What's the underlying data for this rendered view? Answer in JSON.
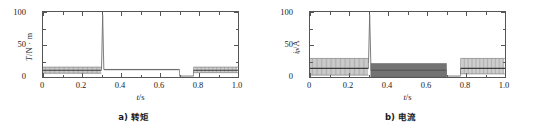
{
  "figure": {
    "panels": [
      {
        "id": "panel-torque",
        "caption": "a) 转矩",
        "ylabel_main": "T",
        "ylabel_unit": "/N · m",
        "xlabel_var": "t",
        "xlabel_unit": "/s"
      },
      {
        "id": "panel-current",
        "caption": "b) 电流",
        "ylabel_main": "i",
        "ylabel_sub": "p",
        "ylabel_unit": "/A",
        "xlabel_var": "t",
        "xlabel_unit": "/s"
      }
    ]
  },
  "chart_data": [
    {
      "type": "line",
      "id": "torque",
      "title": "a) 转矩",
      "xlabel": "t/s",
      "ylabel": "T/N · m",
      "xlim": [
        0,
        1.0
      ],
      "ylim": [
        0,
        105
      ],
      "xticks": [
        0,
        0.2,
        0.4,
        0.6,
        0.8,
        1.0
      ],
      "xticklabels": [
        "0",
        "0.2",
        "0.4",
        "0.6",
        "0.8",
        "1.0"
      ],
      "yticks": [
        0,
        50,
        100
      ],
      "yticklabels": [
        "0",
        "50",
        "100"
      ],
      "grid": false,
      "legend": "none",
      "line_color": "#6e6e6e",
      "segments": [
        {
          "name": "startup-oscillation",
          "x_start": 0.0,
          "x_end": 0.3,
          "mode": "oscillating-band",
          "y_low": 6,
          "y_high": 16,
          "y_mean": 11,
          "cycles": 46,
          "note": "dense square-wave ripple band"
        },
        {
          "name": "load-step-spike",
          "x_start": 0.3,
          "x_end": 0.312,
          "mode": "spike",
          "y_peak": 100,
          "y_base": 12
        },
        {
          "name": "steady-load",
          "x_start": 0.312,
          "x_end": 0.7,
          "mode": "flat-band",
          "y_low": 11,
          "y_high": 13,
          "y_mean": 12
        },
        {
          "name": "unload-dip",
          "x_start": 0.7,
          "x_end": 0.772,
          "mode": "flat",
          "y_mean": 1.5
        },
        {
          "name": "restart-oscillation",
          "x_start": 0.772,
          "x_end": 1.0,
          "mode": "oscillating-band",
          "y_low": 7,
          "y_high": 16,
          "y_mean": 11,
          "cycles": 33
        }
      ]
    },
    {
      "type": "line",
      "id": "current",
      "title": "b) 电流",
      "xlabel": "t/s",
      "ylabel": "i_p/A",
      "xlim": [
        0,
        1.0
      ],
      "ylim": [
        0,
        105
      ],
      "xticks": [
        0,
        0.2,
        0.4,
        0.6,
        0.8,
        1.0
      ],
      "xticklabels": [
        "0",
        "0.2",
        "0.4",
        "0.6",
        "0.8",
        "1.0"
      ],
      "yticks": [
        0,
        50,
        100
      ],
      "yticklabels": [
        "0",
        "50",
        "100"
      ],
      "grid": false,
      "legend": "none",
      "line_color": "#6e6e6e",
      "segments": [
        {
          "name": "startup-oscillation",
          "x_start": 0.0,
          "x_end": 0.3,
          "mode": "oscillating-band",
          "y_low": 3,
          "y_high": 30,
          "y_mean": 14,
          "cycles": 46,
          "note": "tall dense ripple band with dark core near 12-16"
        },
        {
          "name": "load-step-spike",
          "x_start": 0.3,
          "x_end": 0.312,
          "mode": "spike",
          "y_peak": 100,
          "y_base": 22
        },
        {
          "name": "steady-load-block",
          "x_start": 0.312,
          "x_end": 0.7,
          "mode": "solid-band",
          "y_low": 0,
          "y_high": 22,
          "y_mean": 11,
          "note": "solid dark filled ripple block"
        },
        {
          "name": "unload-dip",
          "x_start": 0.7,
          "x_end": 0.772,
          "mode": "flat",
          "y_mean": 1.5
        },
        {
          "name": "restart-oscillation",
          "x_start": 0.772,
          "x_end": 1.0,
          "mode": "oscillating-band",
          "y_low": 5,
          "y_high": 30,
          "y_mean": 14,
          "cycles": 33
        }
      ]
    }
  ]
}
